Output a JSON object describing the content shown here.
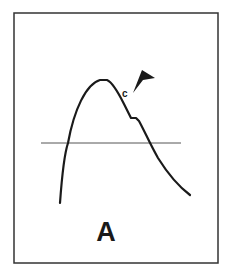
{
  "figure": {
    "panel_label": "A",
    "point_label": "c",
    "colors": {
      "ink": "#1a1a1a",
      "frame": "#333333",
      "baseline": "#555555",
      "background": "#ffffff"
    },
    "frame": {
      "x": 14,
      "y": 13,
      "width": 204,
      "height": 250
    },
    "baseline": {
      "x1": 41,
      "x2": 181,
      "y": 143
    },
    "curve_path": "M60,203 C62,175 64,155 68,143 C74,110 86,84 100,80 L107,80 C112,82 118,92 124,104 L131,118 L136,118 L139,121 C145,132 150,144 158,158 C168,174 178,186 190,195",
    "arrowhead_points": "133,93 142,70 155,78 143,80"
  }
}
